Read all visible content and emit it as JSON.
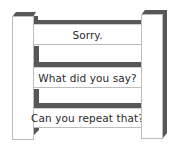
{
  "diagram": {
    "type": "ladder",
    "colors": {
      "shadow": "#575757",
      "face": "#ffffff",
      "outline": "#bdbdbd",
      "text": "#2a2a2a"
    },
    "rungs": [
      {
        "label": "Sorry."
      },
      {
        "label": "What did you say?"
      },
      {
        "label": "Can you repeat that?"
      }
    ]
  }
}
